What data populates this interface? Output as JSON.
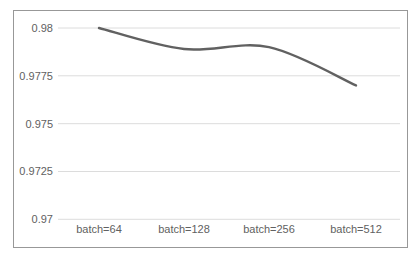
{
  "chart_data": {
    "type": "line",
    "categories": [
      "batch=64",
      "batch=128",
      "batch=256",
      "batch=512"
    ],
    "values": [
      0.98,
      0.9789,
      0.979,
      0.977
    ],
    "title": "",
    "xlabel": "",
    "ylabel": "",
    "ylim": [
      0.97,
      0.98
    ],
    "yticks": [
      0.98,
      0.9775,
      0.975,
      0.9725,
      0.97
    ],
    "ytick_labels": [
      "0.98",
      "0.9775",
      "0.975",
      "0.9725",
      "0.97"
    ],
    "grid": true,
    "legend": "none",
    "smooth": true,
    "colors": {
      "line": "#616161",
      "gridline": "#dcdcdc",
      "tick_text": "#616161",
      "frame_border": "#989898",
      "background": "#ffffff"
    }
  }
}
